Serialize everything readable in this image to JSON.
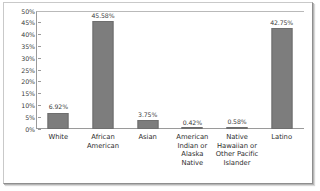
{
  "chart_data": {
    "type": "bar",
    "title": "",
    "subtitle": "",
    "xlabel": "",
    "ylabel": "",
    "ylim": [
      0,
      50
    ],
    "grid": false,
    "legend": "none",
    "ytick_labels": [
      "50%",
      "45%",
      "40%",
      "35%",
      "30%",
      "25%",
      "20%",
      "15%",
      "10%",
      "5%",
      "0%"
    ],
    "ytick_values": [
      50,
      45,
      40,
      35,
      30,
      25,
      20,
      15,
      10,
      5,
      0
    ],
    "categories": [
      "White",
      "African American",
      "Asian",
      "American Indian or Alaska Native",
      "Native Hawaiian or Other Pacific Islander",
      "Latino"
    ],
    "values": [
      6.92,
      45.58,
      3.75,
      0.42,
      0.58,
      42.75
    ],
    "value_labels": [
      "6.92%",
      "45.58%",
      "3.75%",
      "0.42%",
      "0.58%",
      "42.75%"
    ],
    "bar_color": "#7d7d7d",
    "bar_border_color": "#6e6e6e",
    "axis_color": "#9a9a9a",
    "text_color": "#2e2e2e",
    "background": "#ffffff"
  }
}
